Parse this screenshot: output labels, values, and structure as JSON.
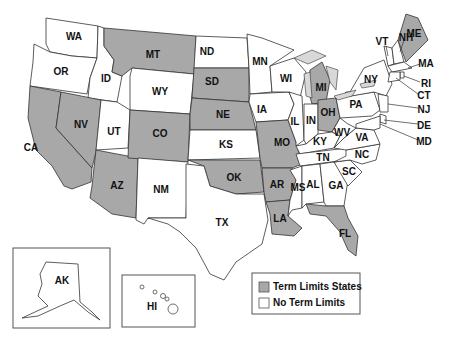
{
  "colors": {
    "term_limits": "#a8a8a8",
    "no_term_limits": "#ffffff",
    "outline": "#333333"
  },
  "legend": [
    {
      "key": "term_limits",
      "label": "Term Limits States"
    },
    {
      "key": "no_term_limits",
      "label": "No Term Limits"
    }
  ],
  "states": [
    {
      "abbr": "WA",
      "status": "no_term_limits"
    },
    {
      "abbr": "OR",
      "status": "no_term_limits"
    },
    {
      "abbr": "ID",
      "status": "no_term_limits"
    },
    {
      "abbr": "MT",
      "status": "term_limits"
    },
    {
      "abbr": "WY",
      "status": "no_term_limits"
    },
    {
      "abbr": "CA",
      "status": "term_limits"
    },
    {
      "abbr": "NV",
      "status": "term_limits"
    },
    {
      "abbr": "UT",
      "status": "no_term_limits"
    },
    {
      "abbr": "AZ",
      "status": "term_limits"
    },
    {
      "abbr": "CO",
      "status": "term_limits"
    },
    {
      "abbr": "NM",
      "status": "no_term_limits"
    },
    {
      "abbr": "ND",
      "status": "no_term_limits"
    },
    {
      "abbr": "SD",
      "status": "term_limits"
    },
    {
      "abbr": "NE",
      "status": "term_limits"
    },
    {
      "abbr": "KS",
      "status": "no_term_limits"
    },
    {
      "abbr": "OK",
      "status": "term_limits"
    },
    {
      "abbr": "TX",
      "status": "no_term_limits"
    },
    {
      "abbr": "MN",
      "status": "no_term_limits"
    },
    {
      "abbr": "IA",
      "status": "no_term_limits"
    },
    {
      "abbr": "MO",
      "status": "term_limits"
    },
    {
      "abbr": "AR",
      "status": "term_limits"
    },
    {
      "abbr": "LA",
      "status": "term_limits"
    },
    {
      "abbr": "WI",
      "status": "no_term_limits"
    },
    {
      "abbr": "IL",
      "status": "no_term_limits"
    },
    {
      "abbr": "MI",
      "status": "term_limits"
    },
    {
      "abbr": "IN",
      "status": "no_term_limits"
    },
    {
      "abbr": "OH",
      "status": "term_limits"
    },
    {
      "abbr": "KY",
      "status": "no_term_limits"
    },
    {
      "abbr": "TN",
      "status": "no_term_limits"
    },
    {
      "abbr": "MS",
      "status": "no_term_limits"
    },
    {
      "abbr": "AL",
      "status": "no_term_limits"
    },
    {
      "abbr": "GA",
      "status": "no_term_limits"
    },
    {
      "abbr": "FL",
      "status": "term_limits"
    },
    {
      "abbr": "SC",
      "status": "no_term_limits"
    },
    {
      "abbr": "NC",
      "status": "no_term_limits"
    },
    {
      "abbr": "VA",
      "status": "no_term_limits"
    },
    {
      "abbr": "WV",
      "status": "no_term_limits"
    },
    {
      "abbr": "PA",
      "status": "no_term_limits"
    },
    {
      "abbr": "NY",
      "status": "no_term_limits"
    },
    {
      "abbr": "VT",
      "status": "no_term_limits"
    },
    {
      "abbr": "NH",
      "status": "no_term_limits"
    },
    {
      "abbr": "ME",
      "status": "term_limits"
    },
    {
      "abbr": "MA",
      "status": "no_term_limits"
    },
    {
      "abbr": "RI",
      "status": "no_term_limits"
    },
    {
      "abbr": "CT",
      "status": "no_term_limits"
    },
    {
      "abbr": "NJ",
      "status": "no_term_limits"
    },
    {
      "abbr": "DE",
      "status": "no_term_limits"
    },
    {
      "abbr": "MD",
      "status": "no_term_limits"
    },
    {
      "abbr": "AK",
      "status": "no_term_limits"
    },
    {
      "abbr": "HI",
      "status": "no_term_limits"
    }
  ]
}
